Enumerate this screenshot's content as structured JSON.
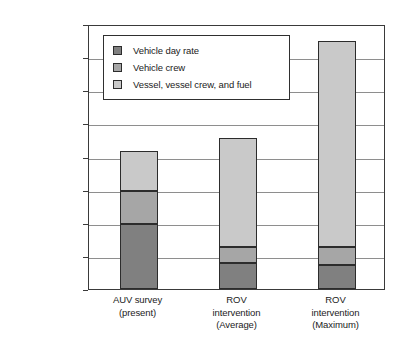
{
  "chart_data": {
    "type": "bar",
    "subtype": "stacked-bar",
    "title": "",
    "xlabel": "",
    "ylabel": "",
    "categories": [
      "AUV survey\n(present)",
      "ROV\nintervention\n(Average)",
      "ROV\nintervention\n(Maximum)"
    ],
    "category_lines": [
      [
        "AUV survey",
        "(present)"
      ],
      [
        "ROV",
        "intervention",
        "(Average)"
      ],
      [
        "ROV",
        "intervention",
        "(Maximum)"
      ]
    ],
    "series": [
      {
        "name": "Vehicle day rate",
        "color": "#808080",
        "values": [
          39000,
          15500,
          14500
        ]
      },
      {
        "name": "Vehicle crew",
        "color": "#a6a6a6",
        "values": [
          20000,
          10000,
          11000
        ]
      },
      {
        "name": "Vessel, vessel crew, and fuel",
        "color": "#c9c9c9",
        "values": [
          24500,
          65500,
          124500
        ]
      }
    ],
    "totals": [
      83500,
      91000,
      150000
    ],
    "ylim": [
      0,
      160000
    ],
    "ytick_values": [
      160000,
      140000,
      120000,
      100000,
      80000,
      60000,
      40000,
      20000,
      0
    ],
    "ytick_labels": [
      "$160,000.00",
      "$140,000.00",
      "$120,000.00",
      "$100,000.00",
      "$80,000.00",
      "$60,000.00",
      "$40,000.00",
      "$20,000.00",
      "$50.00"
    ],
    "grid": true,
    "grid_axis": "y",
    "legend_position": "inside-top-left",
    "legend_entries": [
      "Vehicle day rate",
      "Vehicle crew",
      "Vessel, vessel crew, and fuel"
    ]
  },
  "legend": {
    "items": [
      {
        "label": "Vehicle day rate",
        "color": "#808080"
      },
      {
        "label": "Vehicle crew",
        "color": "#a6a6a6"
      },
      {
        "label": "Vessel, vessel crew, and fuel",
        "color": "#c9c9c9"
      }
    ]
  },
  "y_axis": {
    "ticks": [
      {
        "label": "$160,000.00",
        "value": 160000
      },
      {
        "label": "$140,000.00",
        "value": 140000
      },
      {
        "label": "$120,000.00",
        "value": 120000
      },
      {
        "label": "$100,000.00",
        "value": 100000
      },
      {
        "label": "$80,000.00",
        "value": 80000
      },
      {
        "label": "$60,000.00",
        "value": 60000
      },
      {
        "label": "$40,000.00",
        "value": 40000
      },
      {
        "label": "$20,000.00",
        "value": 20000
      },
      {
        "label": "$50.00",
        "value": 0
      }
    ]
  },
  "x_axis": {
    "categories": [
      {
        "lines": [
          "AUV survey",
          "(present)"
        ]
      },
      {
        "lines": [
          "ROV",
          "intervention",
          "(Average)"
        ]
      },
      {
        "lines": [
          "ROV",
          "intervention",
          "(Maximum)"
        ]
      }
    ]
  },
  "colors": {
    "series_dark": "#808080",
    "series_mid": "#a6a6a6",
    "series_light": "#c9c9c9",
    "axis": "#3a3a3a",
    "grid": "#8e8e8e",
    "text": "#1b1b1b",
    "background": "#ffffff"
  }
}
